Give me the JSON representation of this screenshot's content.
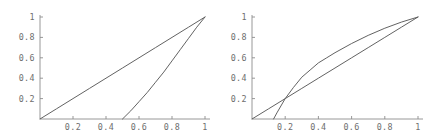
{
  "figure": {
    "background_color": "#ffffff",
    "axis_color": "#8c8c8c",
    "curve_color": "#5a5a5a",
    "label_color": "#6e6e6e",
    "panel_count": 2
  },
  "chart_data": [
    {
      "type": "line",
      "title": "",
      "subtitle": "",
      "xlabel": "",
      "ylabel": "",
      "xlim": [
        0,
        1
      ],
      "ylim": [
        0,
        1
      ],
      "grid": false,
      "legend": "none",
      "panel_name": "left-plot",
      "xticks": [
        0.2,
        0.4,
        0.6,
        0.8,
        1
      ],
      "xtick_labels": [
        "0.2",
        "0.4",
        "0.6",
        "0.8",
        "1"
      ],
      "yticks": [
        0.2,
        0.4,
        0.6,
        0.8,
        1
      ],
      "ytick_labels": [
        "0.2",
        "0.4",
        "0.6",
        "0.8",
        "1"
      ],
      "series": [
        {
          "name": "diagonal",
          "x": [
            0,
            0.1,
            0.2,
            0.3,
            0.4,
            0.5,
            0.6,
            0.7,
            0.8,
            0.9,
            1
          ],
          "values": [
            0,
            0.1,
            0.2,
            0.3,
            0.4,
            0.5,
            0.6,
            0.7,
            0.8,
            0.9,
            1
          ]
        },
        {
          "name": "lower-curve",
          "x": [
            0.5,
            0.55,
            0.6,
            0.65,
            0.7,
            0.75,
            0.8,
            0.85,
            0.9,
            0.95,
            1
          ],
          "values": [
            0,
            0.08,
            0.17,
            0.26,
            0.36,
            0.46,
            0.57,
            0.68,
            0.79,
            0.9,
            1
          ]
        }
      ]
    },
    {
      "type": "line",
      "title": "",
      "subtitle": "",
      "xlabel": "",
      "ylabel": "",
      "xlim": [
        0,
        1
      ],
      "ylim": [
        0,
        1
      ],
      "grid": false,
      "legend": "none",
      "panel_name": "right-plot",
      "xticks": [
        0.2,
        0.4,
        0.6,
        0.8,
        1
      ],
      "xtick_labels": [
        "0.2",
        "0.4",
        "0.6",
        "0.8",
        "1"
      ],
      "yticks": [
        0.2,
        0.4,
        0.6,
        0.8,
        1
      ],
      "ytick_labels": [
        "0.2",
        "0.4",
        "0.6",
        "0.8",
        "1"
      ],
      "series": [
        {
          "name": "diagonal",
          "x": [
            0,
            0.1,
            0.2,
            0.3,
            0.4,
            0.5,
            0.6,
            0.7,
            0.8,
            0.9,
            1
          ],
          "values": [
            0,
            0.1,
            0.2,
            0.3,
            0.4,
            0.5,
            0.6,
            0.7,
            0.8,
            0.9,
            1
          ]
        },
        {
          "name": "concave-curve",
          "x": [
            0.13,
            0.15,
            0.2,
            0.25,
            0.3,
            0.35,
            0.4,
            0.45,
            0.5,
            0.6,
            0.7,
            0.8,
            0.9,
            1
          ],
          "values": [
            0,
            0.06,
            0.2,
            0.31,
            0.41,
            0.48,
            0.55,
            0.6,
            0.65,
            0.74,
            0.82,
            0.89,
            0.95,
            1
          ]
        }
      ]
    }
  ]
}
